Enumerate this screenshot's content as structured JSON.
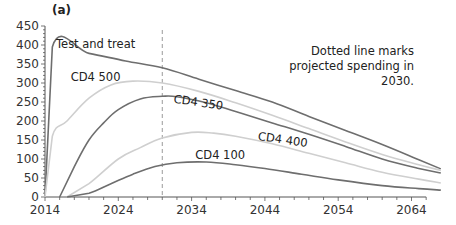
{
  "panel_label": "(a)",
  "note": "Dotted line marks projected spending in 2030.",
  "colors": {
    "dark": "#6e6e6e",
    "light": "#cfcfcf",
    "axis": "#555555",
    "dashed": "#9a9a9a"
  },
  "chart_data": {
    "type": "line",
    "title": "(a)",
    "xlabel": "",
    "ylabel": "",
    "xlim": [
      2014,
      2068
    ],
    "ylim": [
      0,
      450
    ],
    "xticks": [
      2014,
      2024,
      2034,
      2044,
      2054,
      2064
    ],
    "yticks": [
      0,
      50,
      100,
      150,
      200,
      250,
      300,
      350,
      400,
      450
    ],
    "grid": false,
    "annotations": [
      {
        "type": "vline",
        "x": 2030,
        "style": "dashed",
        "text": "Dotted line marks projected spending in 2030."
      }
    ],
    "series": [
      {
        "name": "Test and treat",
        "shade": "dark",
        "label_pos": [
          2015.5,
          392
        ],
        "points": [
          [
            2014,
            0
          ],
          [
            2015,
            395
          ],
          [
            2020,
            378
          ],
          [
            2025,
            358
          ],
          [
            2030,
            340
          ],
          [
            2035,
            310
          ],
          [
            2040,
            280
          ],
          [
            2045,
            250
          ],
          [
            2050,
            212
          ],
          [
            2055,
            175
          ],
          [
            2060,
            138
          ],
          [
            2065,
            98
          ],
          [
            2068,
            74
          ]
        ]
      },
      {
        "name": "CD4 500",
        "shade": "light",
        "label_pos": [
          2017.5,
          305
        ],
        "points": [
          [
            2014,
            0
          ],
          [
            2015,
            160
          ],
          [
            2017,
            200
          ],
          [
            2020,
            260
          ],
          [
            2023,
            295
          ],
          [
            2026,
            305
          ],
          [
            2030,
            300
          ],
          [
            2035,
            278
          ],
          [
            2040,
            248
          ],
          [
            2045,
            215
          ],
          [
            2050,
            180
          ],
          [
            2055,
            145
          ],
          [
            2060,
            112
          ],
          [
            2065,
            85
          ],
          [
            2068,
            70
          ]
        ]
      },
      {
        "name": "CD4 350",
        "shade": "dark",
        "label_pos": [
          2031.5,
          248
        ],
        "points": [
          [
            2016,
            0
          ],
          [
            2018,
            80
          ],
          [
            2020,
            150
          ],
          [
            2022,
            195
          ],
          [
            2024,
            230
          ],
          [
            2027,
            258
          ],
          [
            2030,
            265
          ],
          [
            2032,
            264
          ],
          [
            2036,
            248
          ],
          [
            2040,
            225
          ],
          [
            2045,
            195
          ],
          [
            2050,
            165
          ],
          [
            2055,
            133
          ],
          [
            2060,
            100
          ],
          [
            2065,
            75
          ],
          [
            2068,
            63
          ]
        ]
      },
      {
        "name": "CD4 400",
        "shade": "light",
        "label_pos": [
          2043,
          150
        ],
        "points": [
          [
            2017,
            0
          ],
          [
            2020,
            35
          ],
          [
            2024,
            100
          ],
          [
            2027,
            130
          ],
          [
            2030,
            155
          ],
          [
            2034,
            170
          ],
          [
            2037,
            168
          ],
          [
            2040,
            160
          ],
          [
            2045,
            140
          ],
          [
            2050,
            115
          ],
          [
            2055,
            90
          ],
          [
            2060,
            65
          ],
          [
            2065,
            47
          ],
          [
            2068,
            37
          ]
        ]
      },
      {
        "name": "CD4 100",
        "shade": "dark",
        "label_pos": [
          2034.5,
          100
        ],
        "points": [
          [
            2017,
            0
          ],
          [
            2020,
            10
          ],
          [
            2023,
            35
          ],
          [
            2026,
            60
          ],
          [
            2029,
            80
          ],
          [
            2032,
            90
          ],
          [
            2036,
            92
          ],
          [
            2040,
            85
          ],
          [
            2044,
            75
          ],
          [
            2049,
            60
          ],
          [
            2054,
            45
          ],
          [
            2060,
            30
          ],
          [
            2065,
            22
          ],
          [
            2068,
            18
          ]
        ]
      }
    ]
  }
}
